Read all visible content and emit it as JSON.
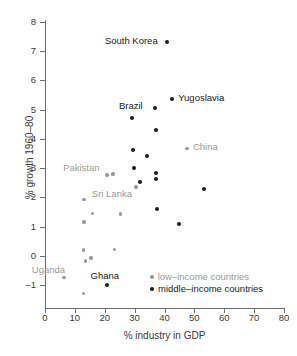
{
  "chart_data": {
    "type": "scatter",
    "title": "",
    "xlabel": "% industry in GDP",
    "ylabel": "% growth 1960–80",
    "xlim": [
      0,
      80
    ],
    "ylim": [
      -1,
      8
    ],
    "xticks": [
      "0",
      "10",
      "20",
      "30",
      "40",
      "50",
      "60",
      "70",
      "80"
    ],
    "yticks": [
      "8",
      "7",
      "6",
      "5",
      "4",
      "3",
      "2",
      "1",
      "0",
      "–1"
    ],
    "grid": false,
    "legend_position": "bottom-right",
    "colors": {
      "low_income": "#9a9a9a",
      "middle_income": "#1a1a1a",
      "axis": "#6f6f6f"
    },
    "series": [
      {
        "name": "low-income countries",
        "color": "#9a9a9a",
        "points": [
          {
            "x": 6.3,
            "y": -0.75,
            "label": "Uganda",
            "label_dx": -32,
            "label_dy": -13
          },
          {
            "x": 12.8,
            "y": -1.3,
            "label": ""
          },
          {
            "x": 12.9,
            "y": 0.2,
            "label": ""
          },
          {
            "x": 13.0,
            "y": 1.15,
            "label": ""
          },
          {
            "x": 13.1,
            "y": 1.93,
            "label": ""
          },
          {
            "x": 13.6,
            "y": -0.18,
            "label": ""
          },
          {
            "x": 15.4,
            "y": -0.08,
            "label": ""
          },
          {
            "x": 15.8,
            "y": 1.44,
            "label": ""
          },
          {
            "x": 20.8,
            "y": 2.76,
            "label": "Pakistan",
            "label_dx": -44,
            "label_dy": -12
          },
          {
            "x": 22.7,
            "y": 2.8,
            "label": ""
          },
          {
            "x": 23.2,
            "y": 0.22,
            "label": ""
          },
          {
            "x": 25.3,
            "y": 1.43,
            "label": ""
          },
          {
            "x": 30.4,
            "y": 2.36,
            "label": "Sri Lanka",
            "label_dx": -44,
            "label_dy": 2
          },
          {
            "x": 47.5,
            "y": 3.68,
            "label": "China",
            "label_dx": 6,
            "label_dy": -6
          }
        ]
      },
      {
        "name": "middle-income countries",
        "color": "#1a1a1a",
        "points": [
          {
            "x": 20.6,
            "y": -1.01,
            "label": "Ghana",
            "label_dx": -16,
            "label_dy": -14
          },
          {
            "x": 29.2,
            "y": 4.72,
            "label": ""
          },
          {
            "x": 29.5,
            "y": 3.62,
            "label": ""
          },
          {
            "x": 29.8,
            "y": 3.02,
            "label": ""
          },
          {
            "x": 31.7,
            "y": 2.52,
            "label": ""
          },
          {
            "x": 34.3,
            "y": 3.42,
            "label": ""
          },
          {
            "x": 36.8,
            "y": 5.07,
            "label": "Brazil",
            "label_dx": -36,
            "label_dy": -7
          },
          {
            "x": 37.0,
            "y": 4.31,
            "label": ""
          },
          {
            "x": 37.2,
            "y": 2.84,
            "label": ""
          },
          {
            "x": 37.3,
            "y": 2.62,
            "label": ""
          },
          {
            "x": 37.4,
            "y": 1.6,
            "label": ""
          },
          {
            "x": 40.8,
            "y": 7.32,
            "label": "South Korea",
            "label_dx": -62,
            "label_dy": -6
          },
          {
            "x": 42.6,
            "y": 5.38,
            "label": "Yugoslavia",
            "label_dx": 6,
            "label_dy": -6
          },
          {
            "x": 45.0,
            "y": 1.1,
            "label": ""
          },
          {
            "x": 53.2,
            "y": 2.28,
            "label": ""
          }
        ]
      }
    ]
  },
  "legend": {
    "low_label": "low–income countries",
    "mid_label": "middle–income countries"
  }
}
